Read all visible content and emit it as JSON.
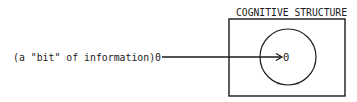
{
  "diagram": {
    "structure_label": "COGNITIVE STRUCTURE",
    "input_label": "(a \"bit\" of information)0",
    "target_label": "0",
    "colors": {
      "stroke": "#1a1a1a",
      "background": "#ffffff"
    },
    "shapes": {
      "structure_box": {
        "x": 229,
        "y": 19,
        "width": 116,
        "height": 77
      },
      "assimilation_circle": {
        "cx": 288,
        "cy": 57,
        "r": 28
      },
      "arrow": {
        "x1": 162,
        "y1": 57,
        "x2": 282,
        "y2": 57
      }
    }
  }
}
